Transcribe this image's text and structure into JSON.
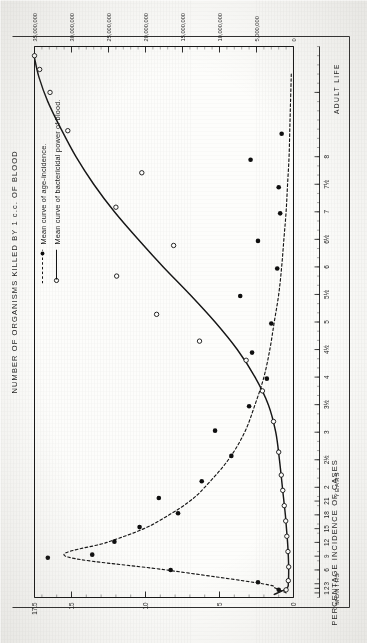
{
  "figure": {
    "left_axis_title": "PERCENTAGE  INCIDENCE  OF  CASES",
    "right_axis_title": "NUMBER OF  ORGANISMS   KILLED BY 1 c.c. OF BLOOD",
    "months_label": "MONTHS",
    "years_label": "YEARS",
    "adult_label": "ADULT  LIFE"
  },
  "legend": {
    "items": [
      {
        "marker": "filled-dot-dashed",
        "label": "Mean curve of age-incidence."
      },
      {
        "marker": "open-circle-solid",
        "label": "Mean curve of bactericidal power of blood."
      }
    ]
  },
  "chart_data": {
    "type": "line",
    "title": "",
    "xlabel": "AGE",
    "x_tick_labels": [
      "1",
      "2",
      "3",
      "6",
      "9",
      "12",
      "15",
      "18",
      "21",
      "2",
      "2½",
      "3",
      "3½",
      "4",
      "4½",
      "5",
      "5½",
      "6",
      "6½",
      "7",
      "7½",
      "8",
      ""
    ],
    "x_tick_positions": [
      0.6,
      1.2,
      1.8,
      3.6,
      5.4,
      7.2,
      9.0,
      10.8,
      12.6,
      14.4,
      18.0,
      21.6,
      25.2,
      28.8,
      32.4,
      36.0,
      39.6,
      43.2,
      46.8,
      50.4,
      54.0,
      57.6,
      66.0
    ],
    "x_axis_segments": [
      {
        "label": "MONTHS",
        "from": 0.0,
        "to": 13.4
      },
      {
        "label": "YEARS",
        "from": 13.4,
        "to": 60.0
      },
      {
        "label": "ADULT  LIFE",
        "from": 60.0,
        "to": 72.0
      }
    ],
    "xlim": [
      0,
      72
    ],
    "grid": false,
    "legend_position": "upper-left-outside",
    "axes": [
      {
        "id": "left",
        "ylabel": "PERCENTAGE  INCIDENCE  OF  CASES",
        "ytick_labels": [
          "0",
          "5",
          "10",
          "15",
          "17.5"
        ],
        "ytick_values": [
          0,
          5,
          10,
          15,
          17.5
        ],
        "ylim": [
          0,
          17.5
        ],
        "minor_ticks_between": 4
      },
      {
        "id": "right",
        "ylabel": "NUMBER OF  ORGANISMS   KILLED BY 1 c.c. OF BLOOD",
        "ytick_labels": [
          "0",
          "5,000,000",
          "10,000,000",
          "15,000,000",
          "20,000,000",
          "25,000,000",
          "30,000,000",
          "35,000,000"
        ],
        "ytick_values": [
          0,
          5000000,
          10000000,
          15000000,
          20000000,
          25000000,
          30000000,
          35000000
        ],
        "ylim": [
          0,
          35000000
        ],
        "minor_ticks_between": 4
      }
    ],
    "series": [
      {
        "name": "Mean curve of age-incidence.",
        "axis": "left",
        "style": "dashed",
        "marker": "filled-dot",
        "units": "percentage incidence of cases",
        "points": [
          {
            "x": 0.6,
            "y": 0.5
          },
          {
            "x": 1.2,
            "y": 1.2
          },
          {
            "x": 1.8,
            "y": 2.1
          },
          {
            "x": 3.6,
            "y": 8.6
          },
          {
            "x": 5.4,
            "y": 15.4
          },
          {
            "x": 7.2,
            "y": 12.6
          },
          {
            "x": 9.0,
            "y": 10.1
          },
          {
            "x": 10.8,
            "y": 8.4
          },
          {
            "x": 12.6,
            "y": 7.0
          },
          {
            "x": 14.4,
            "y": 6.0
          },
          {
            "x": 18.0,
            "y": 4.4
          },
          {
            "x": 21.6,
            "y": 3.3
          },
          {
            "x": 25.2,
            "y": 2.6
          },
          {
            "x": 28.8,
            "y": 2.0
          },
          {
            "x": 32.4,
            "y": 1.6
          },
          {
            "x": 36.0,
            "y": 1.3
          },
          {
            "x": 39.6,
            "y": 1.0
          },
          {
            "x": 43.2,
            "y": 0.8
          },
          {
            "x": 46.8,
            "y": 0.65
          },
          {
            "x": 50.4,
            "y": 0.5
          },
          {
            "x": 54.0,
            "y": 0.4
          },
          {
            "x": 57.6,
            "y": 0.3
          },
          {
            "x": 61.2,
            "y": 0.25
          },
          {
            "x": 64.8,
            "y": 0.2
          },
          {
            "x": 68.4,
            "y": 0.15
          }
        ],
        "scatter_points": [
          {
            "x": 1.0,
            "y": 1.0
          },
          {
            "x": 2.0,
            "y": 2.4
          },
          {
            "x": 3.6,
            "y": 8.3
          },
          {
            "x": 5.2,
            "y": 16.6
          },
          {
            "x": 5.6,
            "y": 13.6
          },
          {
            "x": 7.3,
            "y": 12.1
          },
          {
            "x": 9.2,
            "y": 10.4
          },
          {
            "x": 11.0,
            "y": 7.8
          },
          {
            "x": 13.0,
            "y": 9.1
          },
          {
            "x": 15.2,
            "y": 6.2
          },
          {
            "x": 18.5,
            "y": 4.2
          },
          {
            "x": 21.8,
            "y": 5.3
          },
          {
            "x": 25.0,
            "y": 3.0
          },
          {
            "x": 28.6,
            "y": 1.8
          },
          {
            "x": 32.0,
            "y": 2.8
          },
          {
            "x": 35.8,
            "y": 1.5
          },
          {
            "x": 39.4,
            "y": 3.6
          },
          {
            "x": 43.0,
            "y": 1.1
          },
          {
            "x": 46.6,
            "y": 2.4
          },
          {
            "x": 50.2,
            "y": 0.9
          },
          {
            "x": 53.6,
            "y": 1.0
          },
          {
            "x": 57.2,
            "y": 2.9
          },
          {
            "x": 60.6,
            "y": 0.8
          }
        ]
      },
      {
        "name": "Mean curve of bactericidal power of blood.",
        "axis": "right",
        "style": "solid",
        "marker": "open-circle",
        "units": "organisms killed by 1 c.c. of blood",
        "points": [
          {
            "x": 0.4,
            "y": 2600000
          },
          {
            "x": 1.2,
            "y": 900000
          },
          {
            "x": 2.0,
            "y": 700000
          },
          {
            "x": 3.6,
            "y": 650000
          },
          {
            "x": 5.4,
            "y": 700000
          },
          {
            "x": 7.2,
            "y": 800000
          },
          {
            "x": 9.0,
            "y": 950000
          },
          {
            "x": 10.8,
            "y": 1100000
          },
          {
            "x": 12.6,
            "y": 1300000
          },
          {
            "x": 14.4,
            "y": 1500000
          },
          {
            "x": 18.0,
            "y": 1900000
          },
          {
            "x": 21.6,
            "y": 2400000
          },
          {
            "x": 25.2,
            "y": 3400000
          },
          {
            "x": 28.8,
            "y": 5200000
          },
          {
            "x": 32.4,
            "y": 7600000
          },
          {
            "x": 36.0,
            "y": 10600000
          },
          {
            "x": 39.6,
            "y": 14000000
          },
          {
            "x": 43.2,
            "y": 17600000
          },
          {
            "x": 46.8,
            "y": 21000000
          },
          {
            "x": 50.4,
            "y": 24200000
          },
          {
            "x": 54.0,
            "y": 27000000
          },
          {
            "x": 57.6,
            "y": 29400000
          },
          {
            "x": 61.2,
            "y": 31400000
          },
          {
            "x": 64.8,
            "y": 33200000
          },
          {
            "x": 68.0,
            "y": 34400000
          },
          {
            "x": 70.5,
            "y": 35000000
          }
        ],
        "scatter_points": [
          {
            "x": 1.0,
            "y": 1000000
          },
          {
            "x": 2.2,
            "y": 700000
          },
          {
            "x": 4.0,
            "y": 650000
          },
          {
            "x": 6.0,
            "y": 750000
          },
          {
            "x": 8.0,
            "y": 900000
          },
          {
            "x": 10.0,
            "y": 1050000
          },
          {
            "x": 12.0,
            "y": 1250000
          },
          {
            "x": 14.0,
            "y": 1450000
          },
          {
            "x": 16.0,
            "y": 1650000
          },
          {
            "x": 19.0,
            "y": 2000000
          },
          {
            "x": 23.0,
            "y": 2700000
          },
          {
            "x": 27.0,
            "y": 4200000
          },
          {
            "x": 31.0,
            "y": 6400000
          },
          {
            "x": 33.5,
            "y": 12700000
          },
          {
            "x": 37.0,
            "y": 18500000
          },
          {
            "x": 42.0,
            "y": 23900000
          },
          {
            "x": 46.0,
            "y": 16200000
          },
          {
            "x": 51.0,
            "y": 24000000
          },
          {
            "x": 55.5,
            "y": 20500000
          },
          {
            "x": 61.0,
            "y": 30500000
          },
          {
            "x": 66.0,
            "y": 32900000
          },
          {
            "x": 69.0,
            "y": 34300000
          },
          {
            "x": 70.8,
            "y": 35000000
          }
        ]
      }
    ]
  }
}
